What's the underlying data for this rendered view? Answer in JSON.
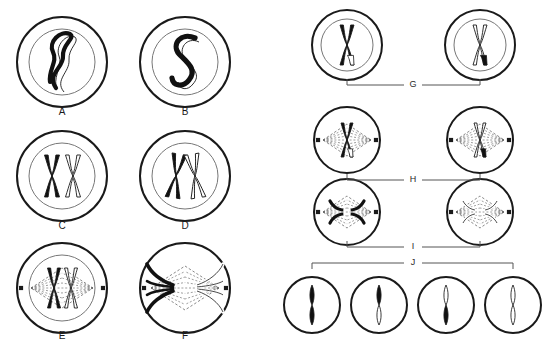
{
  "figure": {
    "background_color": "#ffffff",
    "ink_color": "#1a1a1a",
    "chromosome_black": "#111111",
    "chromosome_white": "#ffffff",
    "spindle_color": "#6b6b6b",
    "bracket_color": "#555555"
  },
  "left_panel": {
    "cells": [
      {
        "label": "A",
        "stage_hint": "interphase",
        "membrane": true,
        "nucleus": true,
        "spindle": false,
        "centrosomes": false,
        "chromosome_form": "thin-tangled-thread",
        "chromosome_colors": [
          "black",
          "white"
        ],
        "cx": 62,
        "cy": 62,
        "r_outer": 45,
        "r_inner": 33,
        "label_x": 62,
        "label_y": 112
      },
      {
        "label": "B",
        "stage_hint": "condensing-threads",
        "membrane": true,
        "nucleus": true,
        "spindle": false,
        "centrosomes": false,
        "chromosome_form": "thick-s-shaped-thread",
        "chromosome_colors": [
          "black",
          "white"
        ],
        "cx": 185,
        "cy": 62,
        "r_outer": 45,
        "r_inner": 33,
        "label_x": 185,
        "label_y": 112
      },
      {
        "label": "C",
        "stage_hint": "paired-homologs-side-by-side",
        "membrane": true,
        "nucleus": true,
        "spindle": false,
        "centrosomes": false,
        "chromosome_form": "two-separate-x-chromosomes",
        "chromosome_colors": [
          "black",
          "white"
        ],
        "cx": 62,
        "cy": 176,
        "r_outer": 45,
        "r_inner": 33,
        "label_x": 62,
        "label_y": 226
      },
      {
        "label": "D",
        "stage_hint": "crossing-over",
        "membrane": true,
        "nucleus": true,
        "spindle": false,
        "centrosomes": false,
        "chromosome_form": "two-crossed-x-chromosomes",
        "chromosome_colors": [
          "black",
          "white"
        ],
        "cx": 185,
        "cy": 176,
        "r_outer": 45,
        "r_inner": 33,
        "label_x": 185,
        "label_y": 226
      },
      {
        "label": "E",
        "stage_hint": "metaphase-I",
        "membrane": true,
        "nucleus": true,
        "spindle": true,
        "centrosomes": true,
        "chromosome_form": "aligned-at-equator",
        "chromosome_colors": [
          "black",
          "white"
        ],
        "cx": 62,
        "cy": 288,
        "r_outer": 45,
        "r_inner": 33,
        "label_x": 62,
        "label_y": 336
      },
      {
        "label": "F",
        "stage_hint": "anaphase-I",
        "membrane": true,
        "nucleus": false,
        "spindle": true,
        "centrosomes": true,
        "chromosome_form": "separating-to-poles",
        "chromosome_colors": [
          "black",
          "white"
        ],
        "cx": 185,
        "cy": 288,
        "r_outer": 45,
        "r_inner": 0,
        "label_x": 185,
        "label_y": 336
      }
    ]
  },
  "right_panel": {
    "cells": [
      {
        "row": "G",
        "stage_hint": "telophase-I-daughter-cell",
        "membrane": true,
        "nucleus": true,
        "spindle": false,
        "centrosomes": false,
        "chromosome_form": "single-x-chromosome",
        "chromosome_colors": [
          "black"
        ],
        "recombinant_tip": "white",
        "cx": 347,
        "cy": 45,
        "r_outer": 35,
        "r_inner": 26
      },
      {
        "row": "G",
        "stage_hint": "telophase-I-daughter-cell",
        "membrane": true,
        "nucleus": true,
        "spindle": false,
        "centrosomes": false,
        "chromosome_form": "single-x-chromosome",
        "chromosome_colors": [
          "white"
        ],
        "recombinant_tip": "black",
        "cx": 480,
        "cy": 45,
        "r_outer": 35,
        "r_inner": 26
      },
      {
        "row": "H",
        "stage_hint": "metaphase-II",
        "membrane": true,
        "nucleus": false,
        "spindle": true,
        "centrosomes": true,
        "chromosome_form": "single-x-at-equator",
        "chromosome_colors": [
          "black"
        ],
        "recombinant_tip": "white",
        "cx": 347,
        "cy": 140,
        "r_outer": 33,
        "r_inner": 0
      },
      {
        "row": "H",
        "stage_hint": "metaphase-II",
        "membrane": true,
        "nucleus": false,
        "spindle": true,
        "centrosomes": true,
        "chromosome_form": "single-x-at-equator",
        "chromosome_colors": [
          "white"
        ],
        "recombinant_tip": "black",
        "cx": 480,
        "cy": 140,
        "r_outer": 33,
        "r_inner": 0
      },
      {
        "row": "I",
        "stage_hint": "anaphase-II",
        "membrane": true,
        "nucleus": false,
        "spindle": true,
        "centrosomes": true,
        "chromosome_form": "chromatids-separating",
        "chromosome_colors": [
          "black"
        ],
        "recombinant_tip": "white",
        "cx": 347,
        "cy": 212,
        "r_outer": 33,
        "r_inner": 0
      },
      {
        "row": "I",
        "stage_hint": "anaphase-II",
        "membrane": true,
        "nucleus": false,
        "spindle": true,
        "centrosomes": true,
        "chromosome_form": "chromatids-separating",
        "chromosome_colors": [
          "white"
        ],
        "recombinant_tip": "black",
        "cx": 480,
        "cy": 212,
        "r_outer": 33,
        "r_inner": 0
      },
      {
        "row": "J",
        "stage_hint": "gamete",
        "membrane": true,
        "nucleus": false,
        "spindle": false,
        "centrosomes": false,
        "chromosome_form": "single-rod",
        "rod_top": "black",
        "rod_bottom": "black",
        "cx": 312,
        "cy": 305,
        "r_outer": 28,
        "r_inner": 0
      },
      {
        "row": "J",
        "stage_hint": "gamete",
        "membrane": true,
        "nucleus": false,
        "spindle": false,
        "centrosomes": false,
        "chromosome_form": "single-rod",
        "rod_top": "black",
        "rod_bottom": "white",
        "cx": 379,
        "cy": 305,
        "r_outer": 28,
        "r_inner": 0
      },
      {
        "row": "J",
        "stage_hint": "gamete",
        "membrane": true,
        "nucleus": false,
        "spindle": false,
        "centrosomes": false,
        "chromosome_form": "single-rod",
        "rod_top": "white",
        "rod_bottom": "black",
        "cx": 446,
        "cy": 305,
        "r_outer": 28,
        "r_inner": 0
      },
      {
        "row": "J",
        "stage_hint": "gamete",
        "membrane": true,
        "nucleus": false,
        "spindle": false,
        "centrosomes": false,
        "chromosome_form": "single-rod",
        "rod_top": "white",
        "rod_bottom": "white",
        "cx": 513,
        "cy": 305,
        "r_outer": 28,
        "r_inner": 0
      }
    ],
    "brackets": [
      {
        "label": "G",
        "x1": 347,
        "x2": 480,
        "y": 85,
        "tick": "up",
        "label_x": 413,
        "label_y": 85
      },
      {
        "label": "H",
        "x1": 347,
        "x2": 480,
        "y": 180,
        "tick": "up",
        "label_x": 413,
        "label_y": 180
      },
      {
        "label": "I",
        "x1": 347,
        "x2": 480,
        "y": 247,
        "tick": "up",
        "label_x": 413,
        "label_y": 247
      },
      {
        "label": "J",
        "x1": 312,
        "x2": 513,
        "y": 263,
        "tick": "down",
        "label_x": 413,
        "label_y": 263
      }
    ]
  }
}
